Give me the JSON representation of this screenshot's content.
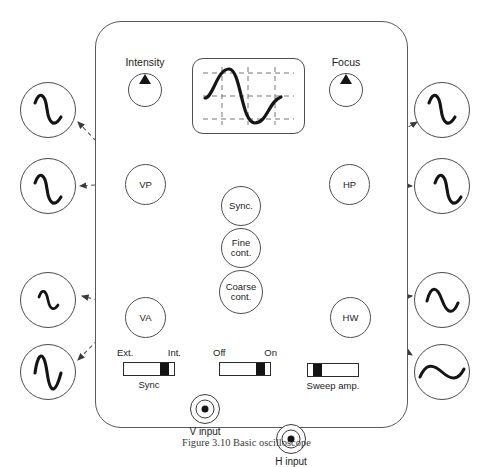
{
  "figure": {
    "caption": "Figure 3.10  Basic oscilloscope",
    "device_name": "oscilloscope-front-panel"
  },
  "panel": {
    "knobs": [
      {
        "id": "intensity",
        "label": "Intensity",
        "x": 128,
        "y": 73
      },
      {
        "id": "focus",
        "label": "Focus",
        "x": 329,
        "y": 73
      }
    ],
    "crt": {
      "name": "crt-display",
      "graticule": {
        "vertical_lines": 3,
        "horizontal_lines": 3,
        "style": "dashed"
      },
      "trace": "sine-wave"
    },
    "position_controls": [
      {
        "id": "vp",
        "label": "VP",
        "x": 125,
        "y": 164,
        "size": 41
      },
      {
        "id": "hp",
        "label": "HP",
        "x": 329,
        "y": 164,
        "size": 41
      }
    ],
    "amplitude_controls": [
      {
        "id": "va",
        "label": "VA",
        "x": 125,
        "y": 297,
        "size": 41
      },
      {
        "id": "hw",
        "label": "HW",
        "x": 330,
        "y": 297,
        "size": 41
      }
    ],
    "center_controls": [
      {
        "id": "sync",
        "line1": "Sync.",
        "line2": "",
        "x": 221,
        "y": 186,
        "size": 40
      },
      {
        "id": "fine-cont",
        "line1": "Fine",
        "line2": "cont.",
        "x": 221,
        "y": 228,
        "size": 40
      },
      {
        "id": "coarse-cont",
        "line1": "Coarse",
        "line2": "cont.",
        "x": 219,
        "y": 270,
        "size": 44
      }
    ],
    "switches": [
      {
        "id": "sync-switch",
        "left_label": "Ext.",
        "right_label": "Int.",
        "under_label": "Sync",
        "position": "right",
        "x": 123,
        "y": 362
      },
      {
        "id": "power-switch",
        "left_label": "Off",
        "right_label": "On",
        "under_label": "",
        "position": "right",
        "x": 219,
        "y": 362
      },
      {
        "id": "sweep-amp-switch",
        "left_label": "",
        "right_label": "",
        "under_label": "Sweep amp.",
        "position": "left",
        "x": 307,
        "y": 363
      }
    ],
    "jacks": [
      {
        "id": "v-input",
        "label": "V input",
        "x": 190,
        "y": 394
      },
      {
        "id": "h-input",
        "label": "H input",
        "x": 276,
        "y": 394
      }
    ]
  },
  "waveform_bubbles": [
    {
      "id": "wave-left-top",
      "side": "left",
      "x": 20,
      "y": 82,
      "shape": "sine-narrow-tall",
      "describes": "vp"
    },
    {
      "id": "wave-left-upper",
      "side": "left",
      "x": 20,
      "y": 158,
      "shape": "sine-narrow-tall",
      "describes": "vp"
    },
    {
      "id": "wave-left-lower",
      "side": "left",
      "x": 20,
      "y": 272,
      "shape": "sine-small",
      "describes": "va"
    },
    {
      "id": "wave-left-bottom",
      "side": "left",
      "x": 20,
      "y": 344,
      "shape": "sine-large-amp",
      "describes": "va"
    },
    {
      "id": "wave-right-top",
      "side": "right",
      "x": 414,
      "y": 82,
      "shape": "sine-narrow-tall",
      "describes": "hp"
    },
    {
      "id": "wave-right-upper",
      "side": "right",
      "x": 414,
      "y": 158,
      "shape": "sine-narrow-tall",
      "describes": "hp"
    },
    {
      "id": "wave-right-lower",
      "side": "right",
      "x": 414,
      "y": 272,
      "shape": "sine-medium",
      "describes": "hw"
    },
    {
      "id": "wave-right-bottom",
      "side": "right",
      "x": 414,
      "y": 344,
      "shape": "sine-wide-flat",
      "describes": "hw"
    }
  ],
  "colors": {
    "outline": "#4e4e4e",
    "ink": "#141414",
    "background": "#ffffff",
    "leader": "#555555"
  }
}
